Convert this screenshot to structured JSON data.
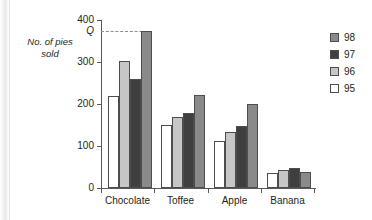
{
  "chart_data": {
    "type": "bar",
    "title": "",
    "xlabel": "",
    "ylabel": "No. of pies sold",
    "categories": [
      "Chocolate",
      "Toffee",
      "Apple",
      "Banana"
    ],
    "series": [
      {
        "name": "95",
        "color": "#ffffff",
        "values": [
          218,
          150,
          113,
          35
        ]
      },
      {
        "name": "96",
        "color": "#c6c6c6",
        "values": [
          302,
          168,
          133,
          43
        ]
      },
      {
        "name": "97",
        "color": "#3f3f3f",
        "values": [
          260,
          179,
          147,
          47
        ]
      },
      {
        "name": "98",
        "color": "#8a8a8a",
        "values": [
          375,
          222,
          201,
          38
        ]
      }
    ],
    "series_draw_order": [
      "95",
      "96",
      "97",
      "98"
    ],
    "ylim": [
      0,
      400
    ],
    "yticks": [
      0,
      100,
      200,
      300,
      400
    ],
    "ytick_labels": [
      "0",
      "100",
      "200",
      "300",
      "400"
    ],
    "grid": false,
    "legend_position": "right",
    "annotations": [
      {
        "name": "q-reference",
        "label": "Q",
        "value": 375,
        "style": "dashed horizontal line from y-axis to tallest Chocolate bar"
      }
    ]
  },
  "axis": {
    "y_title_line1": "No. of pies",
    "y_title_line2": "sold",
    "q_marker_label": "Q"
  },
  "legend": {
    "entries": [
      {
        "label": "98",
        "swatch": "s98"
      },
      {
        "label": "97",
        "swatch": "s97"
      },
      {
        "label": "96",
        "swatch": "s96"
      },
      {
        "label": "95",
        "swatch": "s95"
      }
    ]
  }
}
